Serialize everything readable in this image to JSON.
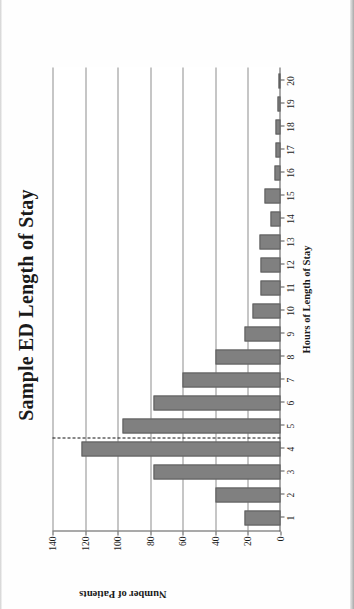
{
  "figure": {
    "title": "Sample ED Length of Stay",
    "orientation": "rotated-90-ccw",
    "background_color": "#ffffff"
  },
  "chart_data": {
    "type": "bar",
    "title": "Sample ED Length of Stay",
    "xlabel": "Hours of Length of Stay",
    "ylabel": "Number of Patients",
    "categories": [
      "1",
      "2",
      "3",
      "4",
      "5",
      "6",
      "7",
      "8",
      "9",
      "10",
      "11",
      "12",
      "13",
      "14",
      "15",
      "16",
      "17",
      "18",
      "19",
      "20"
    ],
    "values": [
      22,
      40,
      78,
      122,
      97,
      78,
      60,
      40,
      22,
      17,
      12,
      12,
      13,
      6,
      10,
      4,
      3,
      3,
      2,
      1
    ],
    "ylim": [
      0,
      140
    ],
    "yticks": [
      0,
      20,
      40,
      60,
      80,
      100,
      120,
      140
    ],
    "ytick_labels": [
      "0",
      "20",
      "40",
      "60",
      "80",
      "100",
      "120",
      "140"
    ],
    "xticks": [
      "1",
      "2",
      "3",
      "4",
      "5",
      "6",
      "7",
      "8",
      "9",
      "10",
      "11",
      "12",
      "13",
      "14",
      "15",
      "16",
      "17",
      "18",
      "19",
      "20"
    ],
    "grid": "horizontal",
    "legend": "none",
    "bar_color": "#808080",
    "bar_border_color": "#5e5e5e",
    "annotations": [
      {
        "name": "median-reference-line",
        "style": "dashed",
        "orientation": "vertical",
        "x_value": 4.5,
        "color": "#111111"
      }
    ]
  }
}
